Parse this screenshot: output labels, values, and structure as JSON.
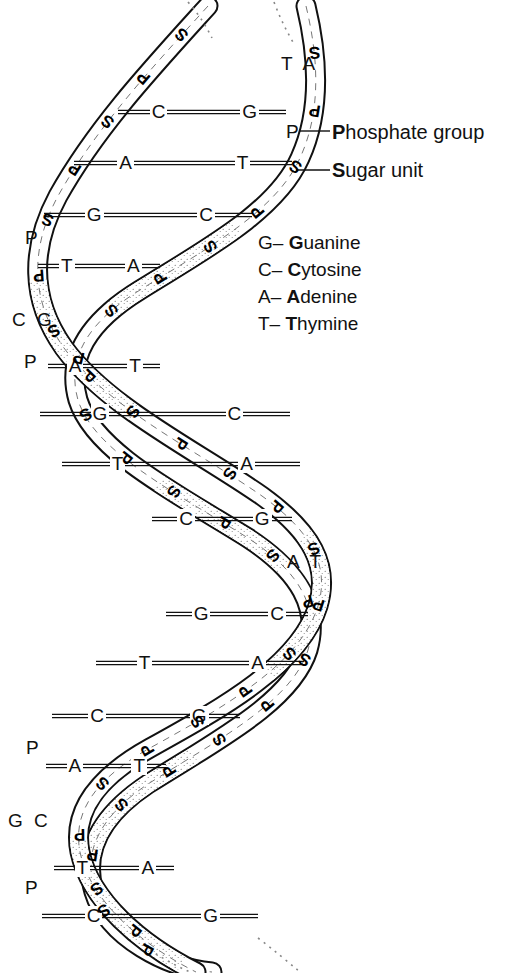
{
  "figure": {
    "ink_color": "#111111",
    "paper_color": "#ffffff"
  },
  "callouts": [
    {
      "id": "phosphate",
      "anchor_label": "P",
      "bold_head": "P",
      "rest": "hosphate group"
    },
    {
      "id": "sugar",
      "anchor_label": "S",
      "bold_head": "S",
      "rest": "ugar unit"
    }
  ],
  "legend": {
    "items": [
      {
        "abbr": "G–",
        "bold_head": "G",
        "rest": "uanine"
      },
      {
        "abbr": "C–",
        "bold_head": "C",
        "rest": "ytosine"
      },
      {
        "abbr": "A–",
        "bold_head": "A",
        "rest": "denine"
      },
      {
        "abbr": "T–",
        "bold_head": "T",
        "rest": "hymine"
      }
    ]
  },
  "crossing_labels": [
    {
      "id": "top-right",
      "text": "T A"
    },
    {
      "id": "left-upper",
      "text": "C G"
    },
    {
      "id": "right-middle",
      "text": "A T"
    },
    {
      "id": "left-lower",
      "text": "G C"
    }
  ],
  "apex_phosphates": [
    {
      "id": "p-right-top",
      "text": "P"
    },
    {
      "id": "p-left-upper",
      "text": "P"
    },
    {
      "id": "p-left-mid",
      "text": "P"
    },
    {
      "id": "p-left-lower",
      "text": "P"
    },
    {
      "id": "p-left-bottom",
      "text": "P"
    }
  ],
  "base_pairs": [
    {
      "left": "C",
      "right": "G",
      "y": 112,
      "x1": 118,
      "x2": 286
    },
    {
      "left": "A",
      "right": "T",
      "y": 163,
      "x1": 74,
      "x2": 292
    },
    {
      "left": "G",
      "right": "C",
      "y": 215,
      "x1": 44,
      "x2": 252
    },
    {
      "left": "T",
      "right": "A",
      "y": 266,
      "x1": 38,
      "x2": 160
    },
    {
      "left": "A",
      "right": "T",
      "y": 366,
      "x1": 48,
      "x2": 160
    },
    {
      "left": "G",
      "right": "C",
      "y": 414,
      "x1": 40,
      "x2": 290
    },
    {
      "left": "T",
      "right": "A",
      "y": 464,
      "x1": 62,
      "x2": 300
    },
    {
      "left": "C",
      "right": "G",
      "y": 519,
      "x1": 152,
      "x2": 292
    },
    {
      "left": "G",
      "right": "C",
      "y": 614,
      "x1": 166,
      "x2": 308
    },
    {
      "left": "T",
      "right": "A",
      "y": 663,
      "x1": 96,
      "x2": 304
    },
    {
      "left": "C",
      "right": "G",
      "y": 716,
      "x1": 52,
      "x2": 240
    },
    {
      "left": "A",
      "right": "T",
      "y": 766,
      "x1": 46,
      "x2": 166
    },
    {
      "left": "T",
      "right": "A",
      "y": 868,
      "x1": 54,
      "x2": 174
    },
    {
      "left": "C",
      "right": "G",
      "y": 916,
      "x1": 42,
      "x2": 258
    }
  ],
  "backbone_units": {
    "sugar": "S",
    "phosphate": "P",
    "strand_a_note": "front ribbon",
    "strand_b_note": "back ribbon"
  }
}
